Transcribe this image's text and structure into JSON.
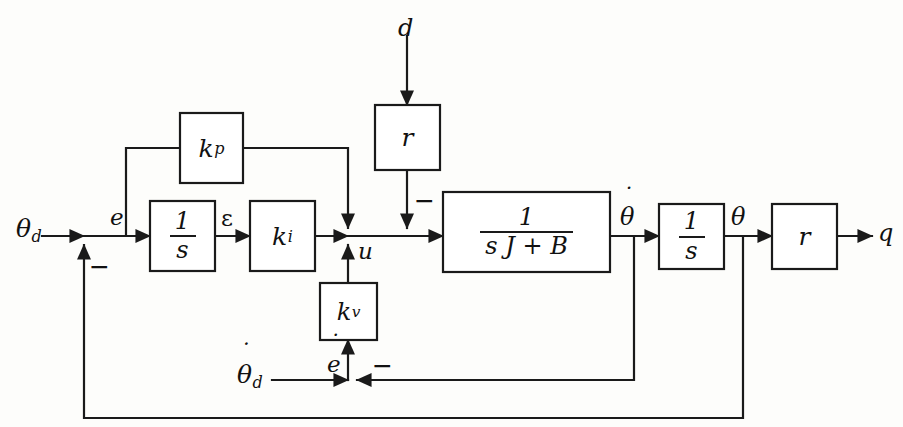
{
  "diagram": {
    "type": "control-block-diagram",
    "width": 903,
    "height": 427,
    "background_color": "#fdfdfb",
    "line_color": "#1a1a1a"
  },
  "blocks": {
    "kp": {
      "name": "proportional-gain",
      "base": "k",
      "sub": "p"
    },
    "ki": {
      "name": "integral-gain",
      "base": "k",
      "sub": "i"
    },
    "kv": {
      "name": "velocity-gain",
      "base": "k",
      "sub": "v"
    },
    "integrator_error": {
      "name": "error-integrator",
      "numerator": "1",
      "denominator": "s"
    },
    "integrator_output": {
      "name": "velocity-integrator",
      "numerator": "1",
      "denominator": "s"
    },
    "plant": {
      "name": "plant-transfer-function",
      "numerator": "1",
      "denominator": "s J + B"
    },
    "gear_disturbance": {
      "name": "disturbance-gear-ratio",
      "label": "r"
    },
    "gear_output": {
      "name": "output-gear-ratio",
      "label": "r"
    }
  },
  "signals": {
    "theta_d": {
      "base": "θ",
      "sub": "d"
    },
    "theta_d_dot": {
      "base": "θ",
      "sub": "d",
      "dot": "˙"
    },
    "error": "e",
    "error_dot": {
      "base": "e",
      "dot": "˙"
    },
    "epsilon": "ε",
    "control": "u",
    "disturbance": "d",
    "theta_dot": {
      "base": "θ",
      "dot": "˙"
    },
    "theta": "θ",
    "output": "q"
  },
  "signs": {
    "position_feedback": "−",
    "velocity_feedback": "−",
    "disturbance": "−"
  }
}
